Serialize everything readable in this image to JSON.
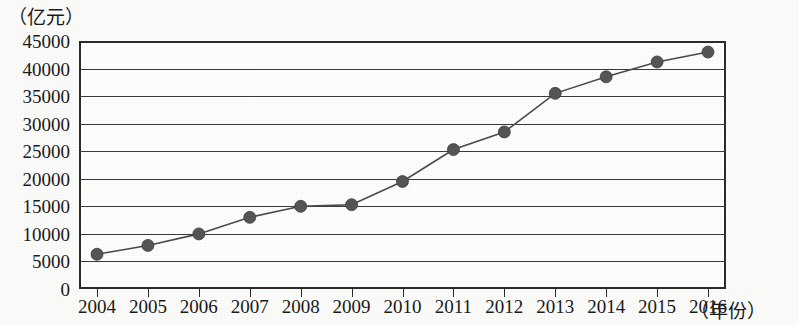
{
  "chart_data": {
    "type": "line",
    "title": "",
    "subtitle": "",
    "xlabel": "（年份）",
    "ylabel": "（亿元）",
    "x": [
      2004,
      2005,
      2006,
      2007,
      2008,
      2009,
      2010,
      2011,
      2012,
      2013,
      2014,
      2015,
      2016
    ],
    "categories": [
      "2004",
      "2005",
      "2006",
      "2007",
      "2008",
      "2009",
      "2010",
      "2011",
      "2012",
      "2013",
      "2014",
      "2015",
      "2016"
    ],
    "values": [
      6300,
      7900,
      10000,
      13000,
      15000,
      15300,
      19500,
      25300,
      28500,
      35500,
      38500,
      41200,
      43000
    ],
    "series": [
      {
        "name": "",
        "values": [
          6300,
          7900,
          10000,
          13000,
          15000,
          15300,
          19500,
          25300,
          28500,
          35500,
          38500,
          41200,
          43000
        ]
      }
    ],
    "ylim": [
      0,
      45000
    ],
    "xlim": [
      2004,
      2016
    ],
    "ytick_labels": [
      "0",
      "5000",
      "10000",
      "15000",
      "20000",
      "25000",
      "30000",
      "35000",
      "40000",
      "45000"
    ],
    "ytick_values": [
      0,
      5000,
      10000,
      15000,
      20000,
      25000,
      30000,
      35000,
      40000,
      45000
    ],
    "xtick_labels": [
      "2004",
      "2005",
      "2006",
      "2007",
      "2008",
      "2009",
      "2010",
      "2011",
      "2012",
      "2013",
      "2014",
      "2015",
      "2016"
    ],
    "grid": "horizontal",
    "legend": "none",
    "legend_position": "",
    "annotations": [],
    "marker": "circle",
    "marker_color": "#555555",
    "line_color": "#4a4a4a",
    "axis_color": "#2b2b2b",
    "background_color": "#fdfdfb"
  }
}
